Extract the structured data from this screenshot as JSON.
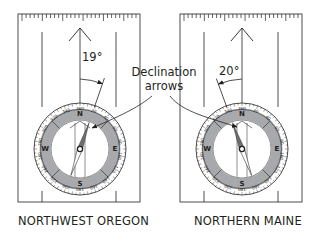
{
  "figure": {
    "callout": {
      "line1": "Declination",
      "line2": "arrows"
    },
    "compasses": [
      {
        "id": "left",
        "caption": "NORTHWEST OREGON",
        "declination_label": "19°",
        "declination_degrees": 19,
        "declination_direction": "east",
        "cardinal": {
          "N": "N",
          "E": "E",
          "S": "S",
          "W": "W"
        },
        "dial_numbers": [
          "360",
          "20",
          "40",
          "60",
          "80",
          "100",
          "120",
          "140",
          "160",
          "180",
          "200",
          "220",
          "240",
          "260",
          "280",
          "300",
          "320",
          "340"
        ]
      },
      {
        "id": "right",
        "caption": "NORTHERN MAINE",
        "declination_label": "20°",
        "declination_degrees": 20,
        "declination_direction": "west",
        "cardinal": {
          "N": "N",
          "E": "E",
          "S": "S",
          "W": "W"
        },
        "dial_numbers": [
          "360",
          "20",
          "40",
          "60",
          "80",
          "100",
          "120",
          "140",
          "160",
          "180",
          "200",
          "220",
          "240",
          "260",
          "280",
          "300",
          "320",
          "340"
        ]
      }
    ],
    "colors": {
      "line": "#231f20",
      "bezel_gray": "#a7a9ac",
      "needle_dark": "#6d6e71",
      "background": "#ffffff"
    }
  }
}
